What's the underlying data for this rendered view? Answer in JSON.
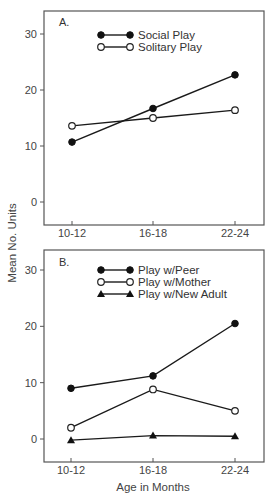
{
  "figure": {
    "ylabel": "Mean No. Units",
    "xlabel": "Age in Months"
  },
  "chart_data": [
    {
      "type": "line",
      "panel_label": "A.",
      "title": "",
      "categories": [
        "10-12",
        "16-18",
        "22-24"
      ],
      "series": [
        {
          "name": "Social Play",
          "marker": "filled-circle",
          "values": [
            10.7,
            16.7,
            22.7
          ]
        },
        {
          "name": "Solitary Play",
          "marker": "open-circle",
          "values": [
            13.6,
            15.0,
            16.4
          ]
        }
      ],
      "xlabel": "",
      "ylabel": "Mean No. Units",
      "yticks": [
        0,
        10,
        20,
        30
      ],
      "ylim": [
        -4,
        34
      ],
      "grid": false,
      "legend_position": "top-center"
    },
    {
      "type": "line",
      "panel_label": "B.",
      "title": "",
      "categories": [
        "10-12",
        "16-18",
        "22-24"
      ],
      "series": [
        {
          "name": "Play w/Peer",
          "marker": "filled-circle",
          "values": [
            9.0,
            11.2,
            20.5
          ]
        },
        {
          "name": "Play w/Mother",
          "marker": "open-circle",
          "values": [
            2.0,
            8.8,
            5.0
          ]
        },
        {
          "name": "Play w/New Adult",
          "marker": "filled-triangle",
          "values": [
            -0.2,
            0.6,
            0.5
          ]
        }
      ],
      "xlabel": "Age in Months",
      "ylabel": "Mean No. Units",
      "yticks": [
        0,
        10,
        20,
        30
      ],
      "ylim": [
        -4,
        34
      ],
      "grid": false,
      "legend_position": "top-center"
    }
  ]
}
